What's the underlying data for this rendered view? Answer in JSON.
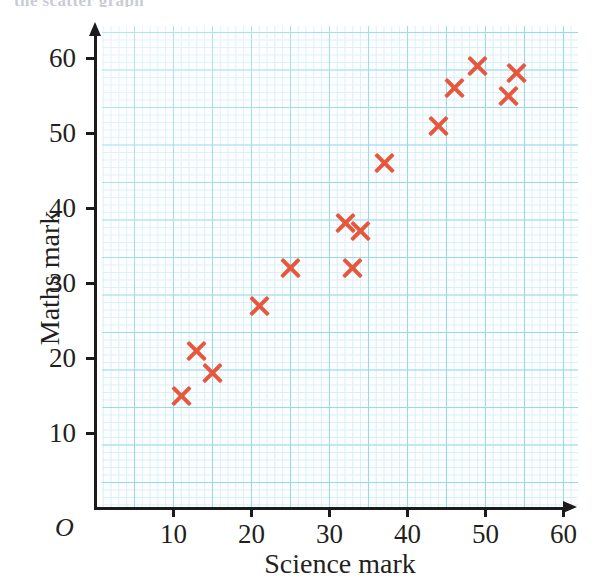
{
  "page": {
    "top_cutoff_text": "the scatter graph",
    "marker_color": "#e8563c",
    "grid_major_color": "#8fd6ee",
    "grid_minor_color": "#d5eef8",
    "axis_color": "#1b1b1b"
  },
  "axes": {
    "origin_label": "O",
    "x_title": "Science mark",
    "y_title": "Maths mark",
    "x_ticks": [
      "10",
      "20",
      "30",
      "40",
      "50",
      "60"
    ],
    "y_ticks": [
      "10",
      "20",
      "30",
      "40",
      "50",
      "60"
    ]
  },
  "chart_data": {
    "type": "scatter",
    "title": "",
    "xlabel": "Science mark",
    "ylabel": "Maths mark",
    "xlim": [
      0,
      65
    ],
    "ylim": [
      0,
      64
    ],
    "xticks": [
      10,
      20,
      30,
      40,
      50,
      60
    ],
    "yticks": [
      10,
      20,
      30,
      40,
      50,
      60
    ],
    "grid": true,
    "grid_minor_step": 1,
    "grid_major_step": 5,
    "legend": "none",
    "marker": "x",
    "marker_color": "#e8563c",
    "n_points": 14,
    "points": [
      {
        "x": 11,
        "y": 15
      },
      {
        "x": 13,
        "y": 21
      },
      {
        "x": 15,
        "y": 18
      },
      {
        "x": 21,
        "y": 27
      },
      {
        "x": 25,
        "y": 32
      },
      {
        "x": 32,
        "y": 38
      },
      {
        "x": 33,
        "y": 32
      },
      {
        "x": 34,
        "y": 37
      },
      {
        "x": 37,
        "y": 46
      },
      {
        "x": 44,
        "y": 51
      },
      {
        "x": 46,
        "y": 56
      },
      {
        "x": 49,
        "y": 59
      },
      {
        "x": 53,
        "y": 55
      },
      {
        "x": 54,
        "y": 58
      }
    ]
  }
}
